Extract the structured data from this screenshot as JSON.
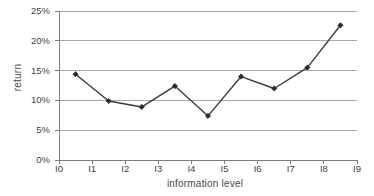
{
  "chart_data": {
    "type": "line",
    "title": "",
    "xlabel": "information level",
    "ylabel": "return",
    "categories": [
      "I0",
      "I1",
      "I2",
      "I3",
      "I4",
      "I5",
      "I6",
      "I7",
      "I8",
      "I9"
    ],
    "x_tick_labels": [
      "I0",
      "I1",
      "I2",
      "I3",
      "I4",
      "I5",
      "I6",
      "I7",
      "I8",
      "I9"
    ],
    "y_tick_labels": [
      "0%",
      "5%",
      "10%",
      "15%",
      "20%",
      "25%"
    ],
    "y_tick_values": [
      0,
      5,
      10,
      15,
      20,
      25
    ],
    "ylim": [
      0,
      25
    ],
    "xlim": [
      0,
      9
    ],
    "grid": true,
    "grid_axis": "y",
    "legend": false,
    "legend_position": "none",
    "marker": "diamond",
    "series": [
      {
        "name": "return",
        "x": [
          0.5,
          1.5,
          2.5,
          3.5,
          4.5,
          5.5,
          6.5,
          7.5,
          8.5
        ],
        "values": [
          14.4,
          9.9,
          8.9,
          12.4,
          7.4,
          14.0,
          12.0,
          15.5,
          22.6
        ]
      }
    ]
  },
  "style": {
    "line_color": "#3b3b3b",
    "marker_color": "#2b2b2b",
    "grid_color": "#a8a8a8",
    "axis_color": "#7d7d7d",
    "text_color": "#3f3f3f",
    "background": "#ffffff"
  }
}
